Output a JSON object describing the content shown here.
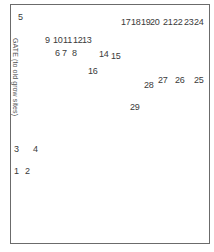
{
  "diagram": {
    "gate_label": "GATE (to old grow sites)",
    "sites": [
      {
        "id": "1",
        "x": 14,
        "y": 166
      },
      {
        "id": "2",
        "x": 25,
        "y": 166
      },
      {
        "id": "3",
        "x": 14,
        "y": 144
      },
      {
        "id": "4",
        "x": 33,
        "y": 144
      },
      {
        "id": "5",
        "x": 18,
        "y": 12
      },
      {
        "id": "6",
        "x": 55,
        "y": 48
      },
      {
        "id": "7",
        "x": 62,
        "y": 48
      },
      {
        "id": "8",
        "x": 72,
        "y": 48
      },
      {
        "id": "9",
        "x": 45,
        "y": 35
      },
      {
        "id": "10",
        "x": 53,
        "y": 35
      },
      {
        "id": "11",
        "x": 63,
        "y": 35
      },
      {
        "id": "12",
        "x": 73,
        "y": 35
      },
      {
        "id": "13",
        "x": 82,
        "y": 35
      },
      {
        "id": "14",
        "x": 99,
        "y": 49
      },
      {
        "id": "15",
        "x": 111,
        "y": 51
      },
      {
        "id": "16",
        "x": 88,
        "y": 66
      },
      {
        "id": "17",
        "x": 121,
        "y": 17
      },
      {
        "id": "18",
        "x": 131,
        "y": 17
      },
      {
        "id": "19",
        "x": 141,
        "y": 17
      },
      {
        "id": "20",
        "x": 150,
        "y": 17
      },
      {
        "id": "21",
        "x": 163,
        "y": 17
      },
      {
        "id": "22",
        "x": 173,
        "y": 17
      },
      {
        "id": "23",
        "x": 184,
        "y": 17
      },
      {
        "id": "24",
        "x": 194,
        "y": 17
      },
      {
        "id": "25",
        "x": 194,
        "y": 75
      },
      {
        "id": "26",
        "x": 175,
        "y": 75
      },
      {
        "id": "27",
        "x": 158,
        "y": 75
      },
      {
        "id": "28",
        "x": 144,
        "y": 80
      },
      {
        "id": "29",
        "x": 130,
        "y": 102
      }
    ]
  }
}
